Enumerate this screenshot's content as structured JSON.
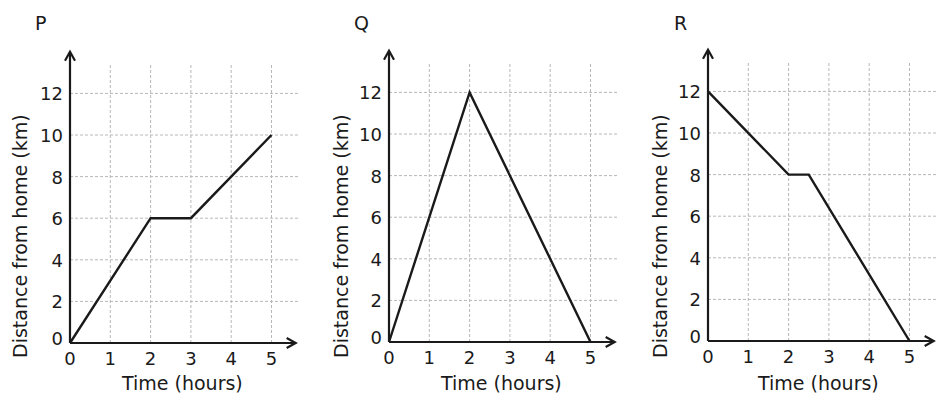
{
  "chart_data": [
    {
      "type": "line",
      "title": "P",
      "xlabel": "Time (hours)",
      "ylabel": "Distance from home (km)",
      "x_ticks": [
        0,
        1,
        2,
        3,
        4,
        5
      ],
      "y_ticks": [
        0,
        2,
        4,
        6,
        8,
        10,
        12
      ],
      "xlim": [
        0,
        5
      ],
      "ylim": [
        0,
        12
      ],
      "grid": true,
      "series": [
        {
          "name": "P",
          "x": [
            0,
            2,
            3,
            5
          ],
          "y": [
            0,
            6,
            6,
            10
          ]
        }
      ]
    },
    {
      "type": "line",
      "title": "Q",
      "xlabel": "Time (hours)",
      "ylabel": "Distance from home (km)",
      "x_ticks": [
        0,
        1,
        2,
        3,
        4,
        5
      ],
      "y_ticks": [
        0,
        2,
        4,
        6,
        8,
        10,
        12
      ],
      "xlim": [
        0,
        5
      ],
      "ylim": [
        0,
        12
      ],
      "grid": true,
      "series": [
        {
          "name": "Q",
          "x": [
            0,
            2,
            5
          ],
          "y": [
            0,
            12,
            0
          ]
        }
      ]
    },
    {
      "type": "line",
      "title": "R",
      "xlabel": "Time (hours)",
      "ylabel": "Distance from home (km)",
      "x_ticks": [
        0,
        1,
        2,
        3,
        4,
        5
      ],
      "y_ticks": [
        0,
        2,
        4,
        6,
        8,
        10,
        12
      ],
      "xlim": [
        0,
        5
      ],
      "ylim": [
        0,
        12
      ],
      "grid": true,
      "series": [
        {
          "name": "R",
          "x": [
            0,
            2,
            2.5,
            5
          ],
          "y": [
            12,
            8,
            8,
            0
          ]
        }
      ]
    }
  ],
  "panels": [
    {
      "label": "P",
      "xlabel": "Time (hours)",
      "ylabel": "Distance from home (km)"
    },
    {
      "label": "Q",
      "xlabel": "Time (hours)",
      "ylabel": "Distance from home (km)"
    },
    {
      "label": "R",
      "xlabel": "Time (hours)",
      "ylabel": "Distance from home (km)"
    }
  ],
  "style": {
    "line_color": "#1a1a1a",
    "grid_color": "#b8b8b8",
    "axis_color": "#1a1a1a"
  }
}
